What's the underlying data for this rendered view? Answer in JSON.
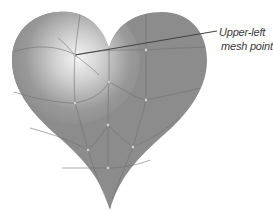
{
  "figure": {
    "fill_color": "#8c8c8c",
    "highlight_color": "#f2f2f2",
    "mesh_line_color": "#6e6e6e",
    "mesh_point_color": "#e8e8e8"
  },
  "callout": {
    "line1": "Upper-left",
    "line2": "mesh point",
    "leader_color": "#444444"
  },
  "mesh_points": [
    {
      "name": "upper-left",
      "x": 75,
      "y": 55
    },
    {
      "x": 109,
      "y": 82
    },
    {
      "x": 146,
      "y": 50
    },
    {
      "x": 146,
      "y": 100
    },
    {
      "x": 75,
      "y": 103
    },
    {
      "x": 108,
      "y": 125
    },
    {
      "x": 88,
      "y": 150
    },
    {
      "x": 133,
      "y": 147
    },
    {
      "x": 108,
      "y": 168
    }
  ]
}
